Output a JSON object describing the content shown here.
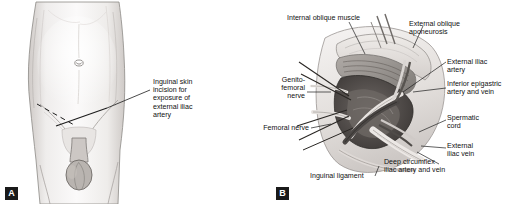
{
  "figure": {
    "panels": [
      {
        "id": "A",
        "letter": "A",
        "title": "Inguinal skin incision for exposure of external iliac artery",
        "labels": [
          {
            "name": "inguinal-skin-incision-label",
            "text": "Inguinal skin\nincision for\nexposure of\nexternal iliac\nartery"
          }
        ]
      },
      {
        "id": "B",
        "letter": "B",
        "title": "Dissected inguinal region showing external iliac vessels",
        "labels": [
          {
            "name": "internal-oblique-muscle-label",
            "text": "Internal oblique muscle"
          },
          {
            "name": "external-oblique-aponeurosis-label",
            "text": "External oblique\naponeurosis"
          },
          {
            "name": "external-iliac-artery-label",
            "text": "External iliac artery"
          },
          {
            "name": "inferior-epigastric-artery-and-vein-label",
            "text": "Inferior epigastric\nartery and vein"
          },
          {
            "name": "spermatic-cord-label",
            "text": "Spermatic\ncord"
          },
          {
            "name": "external-iliac-vein-label",
            "text": "External\niliac vein"
          },
          {
            "name": "deep-circumflex-iliac-artery-and-vein-label",
            "text": "Deep circumflex\niliac artery and vein"
          },
          {
            "name": "inguinal-ligament-label",
            "text": "Inguinal ligament"
          },
          {
            "name": "femoral-nerve-label",
            "text": "Femoral nerve"
          },
          {
            "name": "genitofemoral-nerve-label",
            "text": "Genito-\nfemoral\nnerve"
          }
        ]
      }
    ]
  },
  "colors": {
    "ink": "#111111",
    "letter_bg": "#1a1a1a",
    "letter_fg": "#ffffff",
    "skin_light": "#f2f0ef",
    "skin_shade": "#d9d5d3",
    "muscle": "#8f8b88",
    "muscle_dark": "#6a6663",
    "vessel_dark": "#4a4744",
    "fat": "#e7e3df"
  }
}
